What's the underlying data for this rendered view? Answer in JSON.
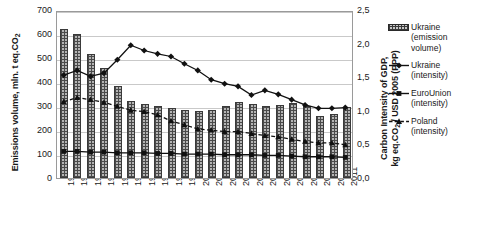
{
  "chart_data": {
    "type": "line",
    "title": "",
    "xlabel": "",
    "categories": [
      "1990",
      "1991",
      "1992",
      "1993",
      "1994",
      "1995",
      "1996",
      "1997",
      "1998",
      "1999",
      "2000",
      "2001",
      "2002",
      "2003",
      "2004",
      "2005",
      "2006",
      "2007",
      "2008",
      "2009",
      "2010",
      "2011"
    ],
    "grid": true,
    "legend_position": "right",
    "axes": {
      "left": {
        "label": "Emissions volume, mln. t eq.CO",
        "label_sub": "2",
        "ticks": [
          "0",
          "100",
          "200",
          "300",
          "400",
          "500",
          "600",
          "700"
        ],
        "min": 0,
        "max": 700,
        "step": 100
      },
      "right": {
        "label_line1": "Carbon Intensity of GDP,",
        "label_line2": "kg eq.CO",
        "label_line2_sub": "2",
        "label_line2_rest": " / USD 2005 (PPP)",
        "ticks": [
          "0,0",
          "0,5",
          "1,0",
          "1,5",
          "2,0",
          "2,5"
        ],
        "min": 0,
        "max": 2.5,
        "step": 0.5
      }
    },
    "series": [
      {
        "name": "Ukraine (emission volume)",
        "legend_line1": "Ukraine",
        "legend_line2": "(emission",
        "legend_line3": "volume)",
        "render": "bar",
        "axis": "left",
        "marker": "none",
        "values": [
          620,
          602,
          518,
          460,
          385,
          320,
          310,
          298,
          290,
          282,
          280,
          285,
          300,
          315,
          310,
          300,
          305,
          312,
          300,
          258,
          265,
          295
        ]
      },
      {
        "name": "Ukraine (intensity)",
        "legend_line1": "Ukraine",
        "legend_line2": "(intensity)",
        "render": "line",
        "axis": "right",
        "marker": "diamond",
        "dash": "none",
        "values": [
          1.55,
          1.62,
          1.53,
          1.58,
          1.78,
          2.0,
          1.92,
          1.87,
          1.83,
          1.72,
          1.62,
          1.48,
          1.42,
          1.38,
          1.25,
          1.32,
          1.26,
          1.18,
          1.1,
          1.05,
          1.05,
          1.06
        ]
      },
      {
        "name": "EuroUnion (intensity)",
        "legend_line1": "EuroUnion",
        "legend_line2": "(intensity)",
        "render": "line",
        "axis": "right",
        "marker": "square",
        "dash": "none",
        "values": [
          0.4,
          0.4,
          0.39,
          0.39,
          0.38,
          0.38,
          0.38,
          0.37,
          0.37,
          0.36,
          0.36,
          0.36,
          0.35,
          0.35,
          0.35,
          0.34,
          0.34,
          0.33,
          0.32,
          0.32,
          0.32,
          0.31
        ]
      },
      {
        "name": "Poland (intensity)",
        "legend_line1": "Poland",
        "legend_line2": "(intensity)",
        "render": "line",
        "axis": "right",
        "marker": "triangle",
        "dash": "dashed",
        "values": [
          1.15,
          1.21,
          1.18,
          1.14,
          1.08,
          1.02,
          1.0,
          0.95,
          0.86,
          0.8,
          0.74,
          0.72,
          0.7,
          0.7,
          0.67,
          0.64,
          0.62,
          0.58,
          0.55,
          0.53,
          0.53,
          0.5
        ]
      }
    ]
  }
}
